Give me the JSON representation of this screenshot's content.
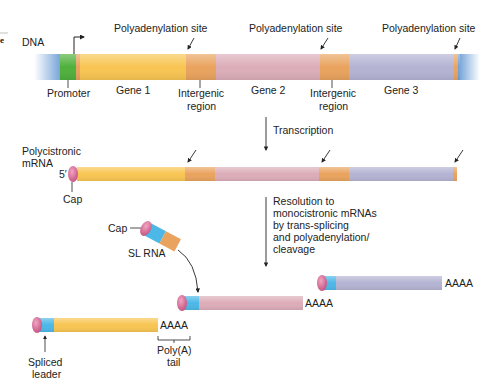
{
  "colors": {
    "promoter": "#4fb03c",
    "gene1": "#f8c552",
    "intergenic": "#e9a35e",
    "gene2": "#dcadb9",
    "gene3": "#b4b3d3",
    "flank": "#6f9fd6",
    "leader": "#4cb8e8",
    "cap": "#d86e98",
    "text": "#222222"
  },
  "dna": {
    "label": "DNA",
    "polyA_labels": [
      "Polyadenylation site",
      "Polyadenylation site",
      "Polyadenylation site"
    ],
    "promoter_label": "Promoter",
    "gene_labels": [
      "Gene 1",
      "Gene 2",
      "Gene 3"
    ],
    "intergenic_label_1a": "Intergenic",
    "intergenic_label_1b": "region",
    "intergenic_label_2a": "Intergenic",
    "intergenic_label_2b": "region"
  },
  "step1": {
    "label": "Transcription"
  },
  "polycistronic": {
    "label_a": "Polycistronic",
    "label_b": "mRNA",
    "five_prime": "5′",
    "cap_label": "Cap"
  },
  "step2": {
    "lines": [
      "Resolution to",
      "monocistronic mRNAs",
      "by trans-splicing",
      "and polyadenylation/",
      "cleavage"
    ]
  },
  "sl_rna": {
    "cap_label": "Cap",
    "label": "SL RNA"
  },
  "products": {
    "polyA": [
      "AAAA",
      "AAAA",
      "AAAA"
    ],
    "spliced_leader_a": "Spliced",
    "spliced_leader_b": "leader",
    "polyA_tail_a": "Poly(A)",
    "polyA_tail_b": "tail"
  },
  "corner_mark": "e"
}
